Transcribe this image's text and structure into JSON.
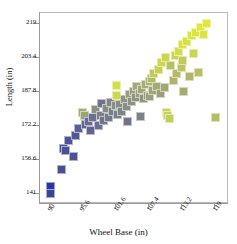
{
  "chart_data": {
    "type": "scatter",
    "title": "",
    "xlabel": "Wheel Base (in)",
    "ylabel": "Length (in)",
    "xlim": [
      88.2,
      121.4
    ],
    "ylim": [
      136.5,
      223.8
    ],
    "xticks": [
      90,
      95.6,
      101.6,
      107.4,
      113.2,
      119
    ],
    "yticks": [
      141,
      156.6,
      172.2,
      187.8,
      203.4,
      219
    ],
    "grid": false,
    "legend": null,
    "colormap": {
      "name": "blue-to-yellowgreen",
      "low": "#2e3a8f",
      "mid": "#8c8f8f",
      "high": "#d9e53c",
      "mapped_to": "Length (in)"
    },
    "marker": {
      "shape": "square",
      "size_px": 9
    },
    "points": [
      {
        "x": 90.0,
        "y": 144.6,
        "c": "#2b37a0"
      },
      {
        "x": 90.0,
        "y": 141.2,
        "c": "#3a4596"
      },
      {
        "x": 92.0,
        "y": 152.4,
        "c": "#4a4f93"
      },
      {
        "x": 92.3,
        "y": 162.0,
        "c": "#474e96"
      },
      {
        "x": 92.6,
        "y": 161.0,
        "c": "#4b5196"
      },
      {
        "x": 93.2,
        "y": 165.5,
        "c": "#4e5497"
      },
      {
        "x": 94.0,
        "y": 158.0,
        "c": "#4c5296"
      },
      {
        "x": 94.4,
        "y": 168.0,
        "c": "#535895"
      },
      {
        "x": 95.0,
        "y": 171.0,
        "c": "#5a5f94"
      },
      {
        "x": 95.6,
        "y": 178.4,
        "c": "#a8ae6a"
      },
      {
        "x": 96.0,
        "y": 176.8,
        "c": "#9aa472"
      },
      {
        "x": 96.2,
        "y": 173.0,
        "c": "#62668f"
      },
      {
        "x": 96.8,
        "y": 174.2,
        "c": "#676b90"
      },
      {
        "x": 97.0,
        "y": 170.0,
        "c": "#5f6492"
      },
      {
        "x": 97.4,
        "y": 176.0,
        "c": "#6c708e"
      },
      {
        "x": 98.0,
        "y": 179.5,
        "c": "#8d9080"
      },
      {
        "x": 98.4,
        "y": 172.5,
        "c": "#6a6e8f"
      },
      {
        "x": 98.8,
        "y": 177.0,
        "c": "#7c8088"
      },
      {
        "x": 99.0,
        "y": 182.4,
        "c": "#6e738d"
      },
      {
        "x": 99.4,
        "y": 174.8,
        "c": "#70748c"
      },
      {
        "x": 99.8,
        "y": 180.0,
        "c": "#868a83"
      },
      {
        "x": 100.2,
        "y": 176.2,
        "c": "#757a8a"
      },
      {
        "x": 100.6,
        "y": 183.0,
        "c": "#7f8486"
      },
      {
        "x": 101.0,
        "y": 179.0,
        "c": "#797e88"
      },
      {
        "x": 101.4,
        "y": 181.5,
        "c": "#8a8e81"
      },
      {
        "x": 101.6,
        "y": 190.6,
        "c": "#d2de45"
      },
      {
        "x": 101.6,
        "y": 186.0,
        "c": "#cdd94c"
      },
      {
        "x": 101.8,
        "y": 177.6,
        "c": "#7b8087"
      },
      {
        "x": 102.2,
        "y": 182.2,
        "c": "#868b83"
      },
      {
        "x": 102.6,
        "y": 178.8,
        "c": "#7e8386"
      },
      {
        "x": 103.0,
        "y": 184.4,
        "c": "#8f9380"
      },
      {
        "x": 103.4,
        "y": 181.0,
        "c": "#8a8f82"
      },
      {
        "x": 103.6,
        "y": 174.0,
        "c": "#6f738c"
      },
      {
        "x": 104.0,
        "y": 186.6,
        "c": "#969a7b"
      },
      {
        "x": 104.2,
        "y": 183.2,
        "c": "#8d9181"
      },
      {
        "x": 104.6,
        "y": 188.0,
        "c": "#9aa078"
      },
      {
        "x": 105.0,
        "y": 185.0,
        "c": "#8f9480"
      },
      {
        "x": 105.2,
        "y": 190.0,
        "c": "#a4aa72"
      },
      {
        "x": 105.6,
        "y": 187.2,
        "c": "#979c7a"
      },
      {
        "x": 105.8,
        "y": 176.4,
        "c": "#7d8287"
      },
      {
        "x": 106.0,
        "y": 189.0,
        "c": "#a0a675"
      },
      {
        "x": 106.4,
        "y": 184.6,
        "c": "#8e9381"
      },
      {
        "x": 106.8,
        "y": 191.0,
        "c": "#a7ad70"
      },
      {
        "x": 107.0,
        "y": 186.2,
        "c": "#959a7c"
      },
      {
        "x": 107.4,
        "y": 192.4,
        "c": "#acb26d"
      },
      {
        "x": 107.4,
        "y": 185.6,
        "c": "#9b9f79"
      },
      {
        "x": 107.8,
        "y": 194.0,
        "c": "#b2b869"
      },
      {
        "x": 108.0,
        "y": 188.6,
        "c": "#a0a576"
      },
      {
        "x": 108.2,
        "y": 196.2,
        "c": "#c0c95a"
      },
      {
        "x": 108.6,
        "y": 190.4,
        "c": "#a6ac71"
      },
      {
        "x": 109.0,
        "y": 198.0,
        "c": "#c6d054"
      },
      {
        "x": 109.4,
        "y": 186.8,
        "c": "#9a9f7a"
      },
      {
        "x": 109.6,
        "y": 201.0,
        "c": "#ccd64e"
      },
      {
        "x": 110.0,
        "y": 189.6,
        "c": "#a3a873"
      },
      {
        "x": 110.2,
        "y": 203.4,
        "c": "#cbd64f"
      },
      {
        "x": 110.4,
        "y": 178.2,
        "c": "#c9d551"
      },
      {
        "x": 110.6,
        "y": 176.8,
        "c": "#c5d156"
      },
      {
        "x": 111.0,
        "y": 175.6,
        "c": "#c2ce59"
      },
      {
        "x": 111.2,
        "y": 200.0,
        "c": "#b8c062"
      },
      {
        "x": 111.6,
        "y": 193.0,
        "c": "#aeb46b"
      },
      {
        "x": 112.0,
        "y": 204.6,
        "c": "#c9d452"
      },
      {
        "x": 112.2,
        "y": 196.0,
        "c": "#b4ba67"
      },
      {
        "x": 112.6,
        "y": 206.0,
        "c": "#d2dd46"
      },
      {
        "x": 113.0,
        "y": 198.8,
        "c": "#bcc45e"
      },
      {
        "x": 113.2,
        "y": 209.4,
        "c": "#d6e141"
      },
      {
        "x": 113.2,
        "y": 202.0,
        "c": "#c0c95a"
      },
      {
        "x": 113.4,
        "y": 187.8,
        "c": "#a5ab71"
      },
      {
        "x": 114.0,
        "y": 211.0,
        "c": "#d8e33e"
      },
      {
        "x": 114.4,
        "y": 194.6,
        "c": "#b0b669"
      },
      {
        "x": 114.8,
        "y": 213.4,
        "c": "#d9e53c"
      },
      {
        "x": 115.2,
        "y": 205.4,
        "c": "#cad552"
      },
      {
        "x": 115.6,
        "y": 215.0,
        "c": "#dae63b"
      },
      {
        "x": 116.0,
        "y": 196.8,
        "c": "#b7bf63"
      },
      {
        "x": 116.4,
        "y": 217.0,
        "c": "#dbe73a"
      },
      {
        "x": 117.0,
        "y": 214.2,
        "c": "#d9e43d"
      },
      {
        "x": 117.4,
        "y": 219.0,
        "c": "#dce83a"
      },
      {
        "x": 119.0,
        "y": 176.2,
        "c": "#b6bd64"
      }
    ]
  }
}
